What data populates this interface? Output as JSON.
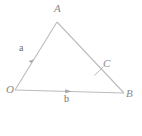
{
  "figure": {
    "background_color": "#ffffff",
    "line_color": "#b9b9b9",
    "label_color": "#8a8a8a",
    "vector_label_color": "#6f6f6f"
  },
  "vertices": {
    "A": {
      "label": "A",
      "x": 57,
      "y": 22
    },
    "O": {
      "label": "O",
      "x": 15,
      "y": 90
    },
    "B": {
      "label": "B",
      "x": 124,
      "y": 93
    },
    "C": {
      "label": "C",
      "x": 101,
      "y": 70
    }
  },
  "vectors": {
    "a": {
      "label": "a",
      "from": "O",
      "to": "A",
      "arrow_at_fraction": 0.45
    },
    "b": {
      "label": "b",
      "from": "O",
      "to": "B",
      "arrow_at_fraction": 0.5
    }
  },
  "segments": [
    {
      "name": "OA",
      "from": "O",
      "to": "A",
      "has_arrow": true
    },
    {
      "name": "AB",
      "from": "A",
      "to": "B",
      "has_arrow": false
    },
    {
      "name": "OB",
      "from": "O",
      "to": "B",
      "has_arrow": true
    }
  ],
  "tick_marks": [
    {
      "name": "tick-on-AB-at-C",
      "x": 99,
      "y": 71,
      "angle_deg": 45
    }
  ]
}
